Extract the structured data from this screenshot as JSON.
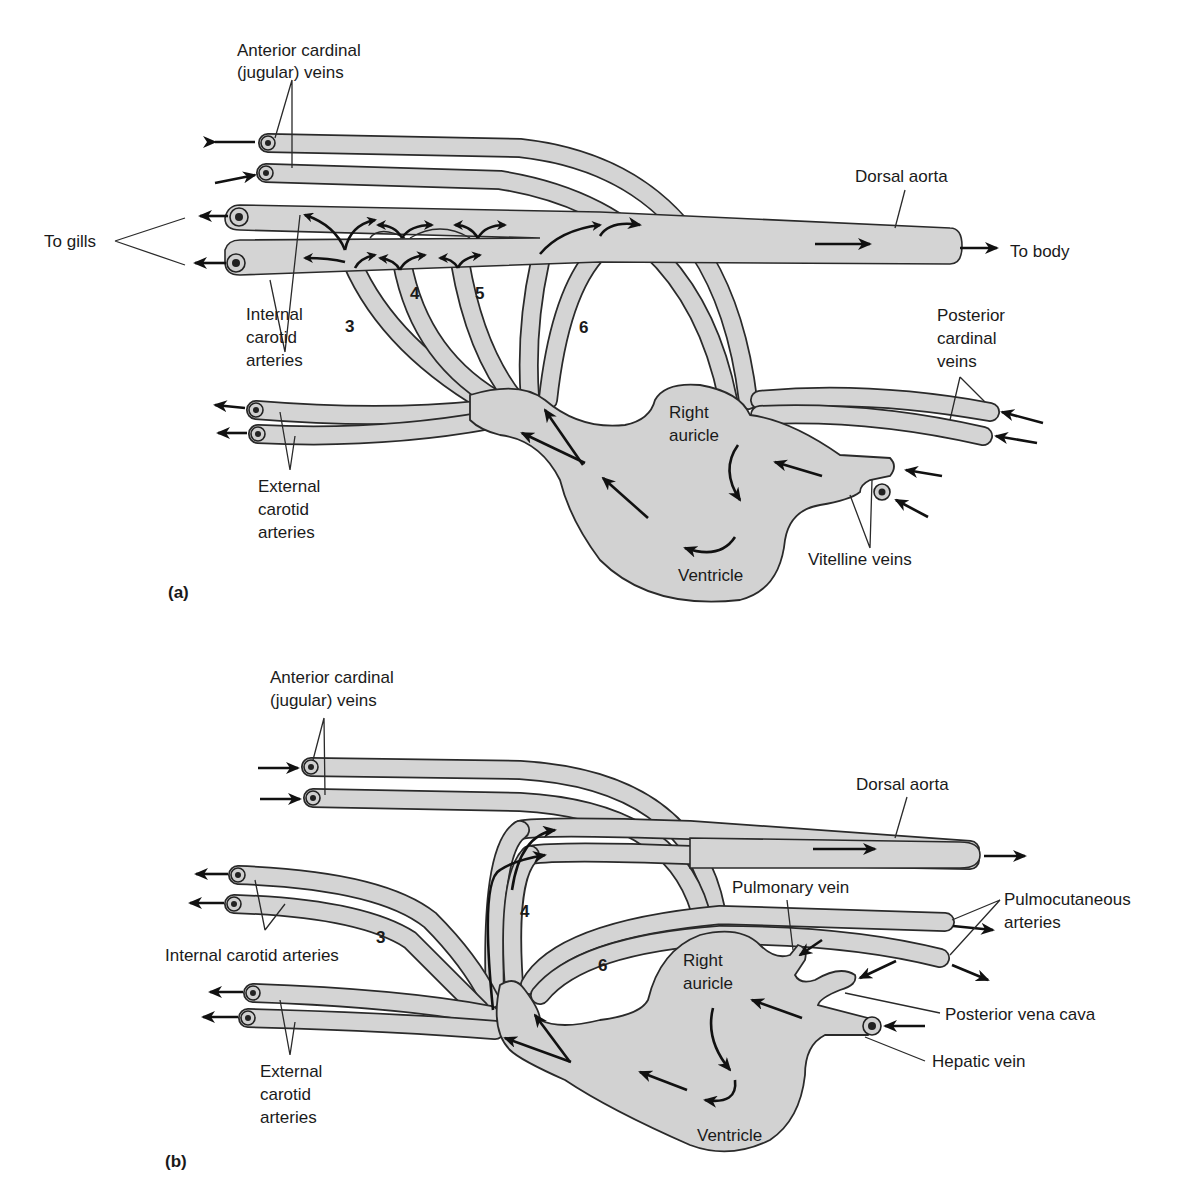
{
  "figure": {
    "panels": [
      {
        "id": "a",
        "panel_label": "(a)",
        "labels": {
          "anterior_cardinal_line1": "Anterior cardinal",
          "anterior_cardinal_line2": "(jugular) veins",
          "to_gills": "To gills",
          "dorsal_aorta": "Dorsal aorta",
          "to_body": "To body",
          "internal_carotid_line1": "Internal",
          "internal_carotid_line2": "carotid",
          "internal_carotid_line3": "arteries",
          "posterior_cardinal_line1": "Posterior",
          "posterior_cardinal_line2": "cardinal",
          "posterior_cardinal_line3": "veins",
          "right_auricle_line1": "Right",
          "right_auricle_line2": "auricle",
          "external_carotid_line1": "External",
          "external_carotid_line2": "carotid",
          "external_carotid_line3": "arteries",
          "vitelline_veins": "Vitelline veins",
          "ventricle": "Ventricle"
        },
        "arch_numbers": [
          "3",
          "4",
          "5",
          "6"
        ]
      },
      {
        "id": "b",
        "panel_label": "(b)",
        "labels": {
          "anterior_cardinal_line1": "Anterior cardinal",
          "anterior_cardinal_line2": "(jugular) veins",
          "dorsal_aorta": "Dorsal aorta",
          "pulmonary_vein": "Pulmonary vein",
          "pulmocutaneous_line1": "Pulmocutaneous",
          "pulmocutaneous_line2": "arteries",
          "internal_carotid": "Internal carotid arteries",
          "right_auricle_line1": "Right",
          "right_auricle_line2": "auricle",
          "posterior_vena_cava": "Posterior vena cava",
          "hepatic_vein": "Hepatic vein",
          "external_carotid_line1": "External",
          "external_carotid_line2": "carotid",
          "external_carotid_line3": "arteries",
          "ventricle": "Ventricle"
        },
        "arch_numbers": [
          "3",
          "4",
          "6"
        ]
      }
    ],
    "colors": {
      "vessel_fill": "#d4d4d4",
      "outline": "#2a2a2a",
      "background": "#ffffff"
    }
  }
}
